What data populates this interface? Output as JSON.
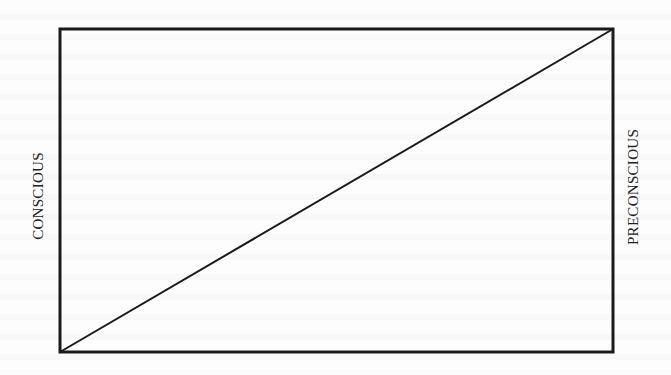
{
  "diagram": {
    "type": "rectangle-with-diagonal",
    "labels": {
      "left": "CONSCIOUS",
      "right": "PRECONSCIOUS"
    },
    "box": {
      "x": 60,
      "y": 29,
      "width": 553,
      "height": 323,
      "stroke_width": 3
    },
    "diagonal": {
      "x1": 60,
      "y1": 352,
      "x2": 613,
      "y2": 29,
      "stroke_width": 2
    },
    "colors": {
      "stroke": "#1a1a1a",
      "text": "#222222",
      "background": "#fdfdfd"
    }
  }
}
